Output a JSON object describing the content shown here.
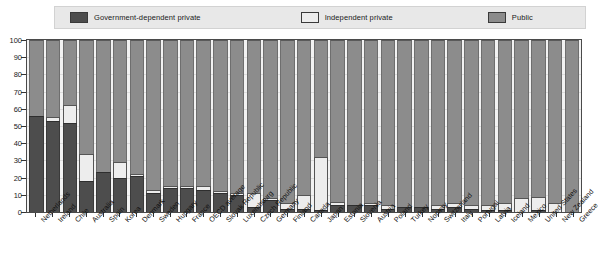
{
  "legend": {
    "entries": [
      {
        "label": "Government-dependent private",
        "color": "#4d4d4d",
        "key": "gov"
      },
      {
        "label": "Independent private",
        "color": "#ededed",
        "key": "indep"
      },
      {
        "label": "Public",
        "color": "#8c8c8c",
        "key": "public"
      }
    ]
  },
  "axis": {
    "y_ticks": [
      "100",
      "90",
      "80",
      "70",
      "60",
      "50",
      "40",
      "30",
      "20",
      "10",
      "0"
    ]
  },
  "colors": {
    "government_dependent_private": "#4d4d4d",
    "independent_private": "#ededed",
    "public": "#8c8c8c",
    "legend_background": "#e8e8e8",
    "plot_background": "#f2f2f2",
    "gridline": "#dcdcdc",
    "axis": "#333333"
  },
  "chart_data": {
    "type": "bar",
    "stacked": true,
    "title": "",
    "subtitle": "",
    "xlabel": "",
    "ylabel": "",
    "ylim": [
      0,
      100
    ],
    "ytick_step": 10,
    "grid": true,
    "legend_position": "top",
    "categories": [
      "Netherlands",
      "Ireland",
      "Chile",
      "Australia",
      "Spain",
      "Korea",
      "Denmark",
      "Sweden",
      "Hungary",
      "France",
      "OECD average",
      "Slovak Republic",
      "Luxembourg",
      "Czech Republic",
      "Germany",
      "Finland",
      "Canada",
      "Japan",
      "Estonia",
      "Slovenia",
      "Austria",
      "Poland",
      "Turkey",
      "Norway",
      "Switzerland",
      "Italy",
      "Portugal",
      "Latvia",
      "Iceland",
      "Mexico",
      "United States",
      "New Zealand",
      "Greece"
    ],
    "series": [
      {
        "name": "Government-dependent private",
        "color": "#4d4d4d",
        "values": [
          56,
          53,
          52,
          18,
          23,
          20,
          21,
          11,
          14,
          14,
          13,
          11,
          10,
          3,
          7,
          2,
          2,
          1,
          4,
          4,
          4,
          2,
          3,
          3,
          2,
          3,
          2,
          1,
          1,
          0,
          1,
          0,
          0
        ]
      },
      {
        "name": "Independent private",
        "color": "#ededed",
        "values": [
          0,
          2,
          10,
          16,
          0,
          9,
          1,
          2,
          1,
          1,
          2,
          1,
          1,
          8,
          1,
          3,
          8,
          31,
          2,
          0,
          1,
          2,
          0,
          0,
          2,
          2,
          2,
          3,
          4,
          8,
          8,
          5,
          0
        ]
      },
      {
        "name": "Public",
        "color": "#8c8c8c",
        "values": [
          44,
          45,
          38,
          66,
          77,
          71,
          78,
          87,
          85,
          85,
          85,
          88,
          89,
          89,
          92,
          95,
          90,
          68,
          94,
          96,
          95,
          96,
          97,
          97,
          96,
          95,
          96,
          96,
          95,
          92,
          91,
          95,
          100
        ]
      }
    ]
  }
}
